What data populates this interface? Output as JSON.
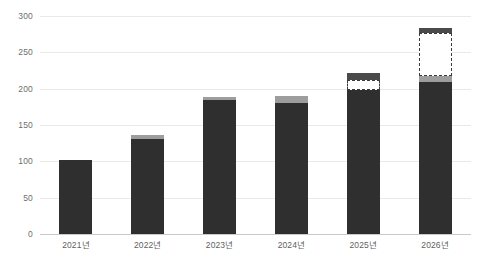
{
  "chart_data": {
    "type": "bar",
    "title": "",
    "subtitle": "",
    "xlabel": "",
    "ylabel": "",
    "categories": [
      "2021년",
      "2022년",
      "2023년",
      "2024년",
      "2025년",
      "2026년"
    ],
    "ylim": [
      0,
      300
    ],
    "yticks": [
      0,
      50,
      100,
      150,
      200,
      250,
      300
    ],
    "ytick_labels": [
      "0",
      "50",
      "100",
      "150",
      "200",
      "250",
      "300"
    ],
    "grid": true,
    "legend": "none",
    "stacked": true,
    "series": [
      {
        "name": "actual",
        "style": "solid-dark",
        "color": "#2f2f2f",
        "values": [
          102,
          131,
          184,
          180,
          198,
          209
        ]
      },
      {
        "name": "increment-gray",
        "style": "solid-gray",
        "color": "#9d9d9d",
        "values": [
          0,
          5,
          4,
          10,
          0,
          9
        ]
      },
      {
        "name": "projected-dashed",
        "style": "dashed-outline",
        "color": "#ffffff",
        "border_color": "#3a3a3a",
        "values": [
          0,
          0,
          0,
          0,
          14,
          59
        ]
      },
      {
        "name": "projection-cap",
        "style": "solid-darkgray",
        "color": "#4a4a4a",
        "values": [
          0,
          0,
          0,
          0,
          10,
          7
        ]
      }
    ],
    "totals": [
      102,
      136,
      188,
      190,
      222,
      284
    ]
  },
  "axis": {
    "y": {
      "ticks": [
        {
          "value": 300,
          "label": "300"
        },
        {
          "value": 250,
          "label": "250"
        },
        {
          "value": 200,
          "label": "200"
        },
        {
          "value": 150,
          "label": "150"
        },
        {
          "value": 100,
          "label": "100"
        },
        {
          "value": 50,
          "label": "50"
        },
        {
          "value": 0,
          "label": "0"
        }
      ]
    },
    "x": {
      "ticks": [
        {
          "label": "2021년"
        },
        {
          "label": "2022년"
        },
        {
          "label": "2023년"
        },
        {
          "label": "2024년"
        },
        {
          "label": "2025년"
        },
        {
          "label": "2026년"
        }
      ]
    }
  },
  "colors": {
    "bar_solid": "#2f2f2f",
    "bar_gray": "#9d9d9d",
    "bar_cap": "#4a4a4a",
    "grid": "#e9e9e9",
    "axis": "#c9c9c9",
    "tick_text": "#6e6e6e",
    "background": "#ffffff"
  }
}
